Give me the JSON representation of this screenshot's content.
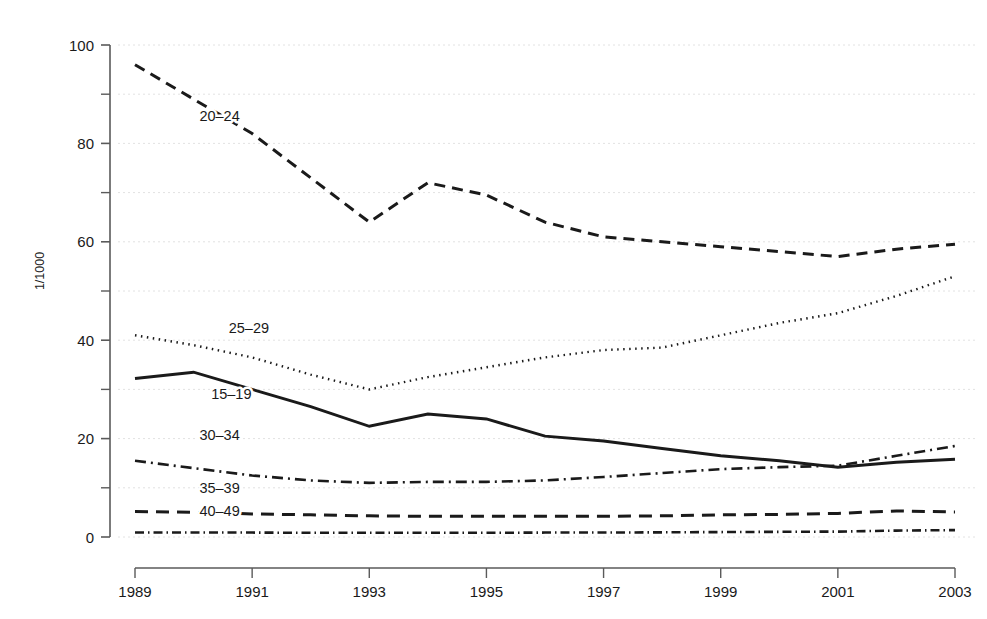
{
  "chart_data": {
    "type": "line",
    "title": "",
    "subtitle": "",
    "xlabel": "",
    "ylabel": "1/1000",
    "xlim": [
      1989,
      2003
    ],
    "ylim": [
      0,
      100
    ],
    "grid": true,
    "grid_axis": "y",
    "grid_step": 10,
    "legend_position": "inline-labels",
    "x": [
      1989,
      1990,
      1991,
      1992,
      1993,
      1994,
      1995,
      1996,
      1997,
      1998,
      1999,
      2000,
      2001,
      2002,
      2003
    ],
    "y_ticks_major": [
      0,
      20,
      40,
      60,
      80,
      100
    ],
    "y_ticks_minor": [
      10,
      30,
      50,
      70,
      90
    ],
    "x_ticks": [
      1989,
      1991,
      1993,
      1995,
      1997,
      1999,
      2001,
      2003
    ],
    "x_tick_labels": [
      "1989",
      "1991",
      "1993",
      "1995",
      "1997",
      "1999",
      "2001",
      "2003"
    ],
    "y_tick_labels": [
      "0",
      "20",
      "40",
      "60",
      "80",
      "100"
    ],
    "series": [
      {
        "name": "20-24",
        "label": "20–24",
        "dash": "dashed",
        "stroke_width": 3.0,
        "dasharray": "11,7",
        "color": "#1a1a1a",
        "label_x": 1990.1,
        "label_y": 84.5,
        "values": [
          96.0,
          89.0,
          82.0,
          73.0,
          64.0,
          72.0,
          69.5,
          64.0,
          61.0,
          60.0,
          59.0,
          58.0,
          57.0,
          58.5,
          59.5
        ]
      },
      {
        "name": "25-29",
        "label": "25–29",
        "dash": "dotted",
        "stroke_width": 2.4,
        "dasharray": "1.5,4.5",
        "color": "#1a1a1a",
        "label_x": 1990.6,
        "label_y": 41.5,
        "values": [
          41.0,
          39.0,
          36.5,
          33.0,
          30.0,
          32.5,
          34.5,
          36.5,
          38.0,
          38.5,
          41.0,
          43.5,
          45.5,
          49.0,
          53.0
        ]
      },
      {
        "name": "15-19",
        "label": "15–19",
        "dash": "solid",
        "stroke_width": 3.0,
        "dasharray": "",
        "color": "#1a1a1a",
        "label_x": 1990.3,
        "label_y": 28.0,
        "values": [
          32.2,
          33.5,
          30.0,
          26.5,
          22.5,
          25.0,
          24.0,
          20.5,
          19.5,
          18.0,
          16.5,
          15.5,
          14.2,
          15.2,
          15.8
        ]
      },
      {
        "name": "30-34",
        "label": "30–34",
        "dash": "dash-dot",
        "stroke_width": 2.6,
        "dasharray": "11,5,2,5",
        "color": "#1a1a1a",
        "label_x": 1990.1,
        "label_y": 19.8,
        "values": [
          15.5,
          14.0,
          12.5,
          11.5,
          11.0,
          11.2,
          11.2,
          11.5,
          12.2,
          13.0,
          13.8,
          14.2,
          14.5,
          16.5,
          18.5
        ]
      },
      {
        "name": "35-39",
        "label": "35–39",
        "dash": "dashed-long",
        "stroke_width": 3.0,
        "dasharray": "13,8",
        "color": "#1a1a1a",
        "label_x": 1990.1,
        "label_y": 9.0,
        "values": [
          5.2,
          5.0,
          4.7,
          4.5,
          4.3,
          4.2,
          4.2,
          4.2,
          4.2,
          4.3,
          4.5,
          4.6,
          4.8,
          5.3,
          5.1
        ]
      },
      {
        "name": "40-49",
        "label": "40–49",
        "dash": "dash-dot-tight",
        "stroke_width": 2.6,
        "dasharray": "9,4,1.5,4",
        "color": "#1a1a1a",
        "label_x": 1990.1,
        "label_y": 4.2,
        "values": [
          0.9,
          0.9,
          0.9,
          0.85,
          0.85,
          0.85,
          0.85,
          0.9,
          0.9,
          0.95,
          1.0,
          1.05,
          1.1,
          1.3,
          1.4
        ]
      }
    ]
  },
  "axes": {
    "y_axis_title": "1/1000",
    "grid_color": "#e2e2e2",
    "axis_color": "#5a5a5a",
    "text_color": "#1a1a1a"
  }
}
